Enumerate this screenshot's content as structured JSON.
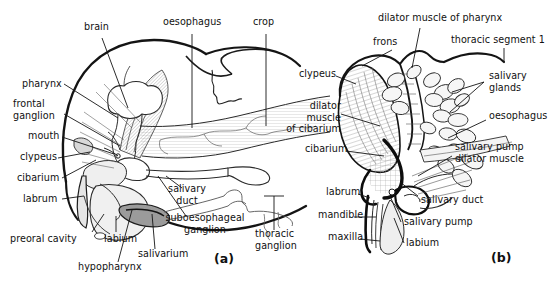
{
  "figure": {
    "background_color": "#ffffff",
    "ink_color": "#111111",
    "tint_color": "#cfcfcf",
    "width": 559,
    "height": 288,
    "panels": [
      {
        "id": "a",
        "caption": "(a)",
        "caption_x": 214,
        "caption_y": 251,
        "labels": [
          {
            "key": "brain",
            "text": "brain",
            "x": 84,
            "y": 27,
            "align": "left",
            "lines": [
              "brain"
            ]
          },
          {
            "key": "oesophagus",
            "text": "oesophagus",
            "x": 163,
            "y": 21,
            "align": "left",
            "lines": [
              "oesophagus"
            ]
          },
          {
            "key": "crop",
            "text": "crop",
            "x": 253,
            "y": 21,
            "align": "left",
            "lines": [
              "crop"
            ]
          },
          {
            "key": "pharynx",
            "text": "pharynx",
            "x": 22,
            "y": 79,
            "align": "left",
            "lines": [
              "pharynx"
            ]
          },
          {
            "key": "frontal-ganglion",
            "text": "frontal ganglion",
            "x": 13,
            "y": 102,
            "align": "left",
            "lines": [
              "frontal",
              "ganglion"
            ]
          },
          {
            "key": "mouth",
            "text": "mouth",
            "x": 28,
            "y": 136,
            "align": "left",
            "lines": [
              "mouth"
            ]
          },
          {
            "key": "clypeus",
            "text": "clypeus",
            "x": 20,
            "y": 157,
            "align": "left",
            "lines": [
              "clypeus"
            ]
          },
          {
            "key": "cibarium",
            "text": "cibarium",
            "x": 17,
            "y": 177,
            "align": "left",
            "lines": [
              "cibarium"
            ]
          },
          {
            "key": "labrum",
            "text": "labrum",
            "x": 23,
            "y": 198,
            "align": "left",
            "lines": [
              "labrum"
            ]
          },
          {
            "key": "preoral-cavity",
            "text": "preoral cavity",
            "x": 13,
            "y": 238,
            "align": "left",
            "lines": [
              "preoral cavity"
            ]
          },
          {
            "key": "labium",
            "text": "labium",
            "x": 104,
            "y": 238,
            "align": "left",
            "lines": [
              "labium"
            ]
          },
          {
            "key": "hypopharynx",
            "text": "hypopharynx",
            "x": 78,
            "y": 266,
            "align": "left",
            "lines": [
              "hypopharynx"
            ]
          },
          {
            "key": "salivarium",
            "text": "salivarium",
            "x": 140,
            "y": 253,
            "align": "left",
            "lines": [
              "salivarium"
            ]
          },
          {
            "key": "salivary-duct",
            "text": "salivary duct",
            "x": 185,
            "y": 192,
            "align": "center",
            "lines": [
              "salivary",
              "duct"
            ]
          },
          {
            "key": "suboesophageal-ganglion",
            "text": "suboesophageal ganglion",
            "x": 163,
            "y": 221,
            "align": "left",
            "lines": [
              "suboesophageal",
              "ganglion"
            ]
          },
          {
            "key": "thoracic-ganglion",
            "text": "thoracic ganglion",
            "x": 255,
            "y": 233,
            "align": "left",
            "lines": [
              "thoracic",
              "ganglion"
            ]
          }
        ]
      },
      {
        "id": "b",
        "caption": "(b)",
        "caption_x": 491,
        "caption_y": 250,
        "labels": [
          {
            "key": "dilator-muscle-of-pharynx",
            "text": "dilator muscle of pharynx",
            "x": 378,
            "y": 15,
            "align": "left",
            "lines": [
              "dilator muscle of pharynx"
            ]
          },
          {
            "key": "frons",
            "text": "frons",
            "x": 373,
            "y": 40,
            "align": "left",
            "lines": [
              "frons"
            ]
          },
          {
            "key": "thoracic-segment-1",
            "text": "thoracic segment 1",
            "x": 456,
            "y": 38,
            "align": "left",
            "lines": [
              "thoracic segment 1"
            ]
          },
          {
            "key": "clypeus-b",
            "text": "clypeus",
            "x": 301,
            "y": 72,
            "align": "left",
            "lines": [
              "clypeus"
            ]
          },
          {
            "key": "salivary-glands",
            "text": "salivary glands",
            "x": 488,
            "y": 73,
            "align": "left",
            "lines": [
              "salivary",
              "glands"
            ]
          },
          {
            "key": "dilator-muscle-of-cibarium",
            "text": "dilator muscle of cibarium",
            "x": 291,
            "y": 104,
            "align": "left",
            "lines": [
              "dilator",
              "muscle",
              "of cibarium"
            ]
          },
          {
            "key": "oesophagus-b",
            "text": "oesophagus",
            "x": 488,
            "y": 114,
            "align": "left",
            "lines": [
              "oesophagus"
            ]
          },
          {
            "key": "cibarium-b",
            "text": "cibarium",
            "x": 307,
            "y": 147,
            "align": "left",
            "lines": [
              "cibarium"
            ]
          },
          {
            "key": "salivary-pump-dilator-muscle",
            "text": "salivary pump dilator muscle",
            "x": 455,
            "y": 145,
            "align": "left",
            "lines": [
              "salivary pump",
              "dilator muscle"
            ]
          },
          {
            "key": "labrum-b",
            "text": "labrum",
            "x": 328,
            "y": 190,
            "align": "left",
            "lines": [
              "labrum"
            ]
          },
          {
            "key": "salivary-duct-b",
            "text": "salivary duct",
            "x": 421,
            "y": 198,
            "align": "left",
            "lines": [
              "salivary duct"
            ]
          },
          {
            "key": "mandible",
            "text": "mandible",
            "x": 320,
            "y": 213,
            "align": "left",
            "lines": [
              "mandible"
            ]
          },
          {
            "key": "salivary-pump",
            "text": "salivary pump",
            "x": 404,
            "y": 220,
            "align": "left",
            "lines": [
              "salivary pump"
            ]
          },
          {
            "key": "maxilla",
            "text": "maxilla",
            "x": 330,
            "y": 235,
            "align": "left",
            "lines": [
              "maxilla"
            ]
          },
          {
            "key": "labium-b",
            "text": "labium",
            "x": 406,
            "y": 241,
            "align": "left",
            "lines": [
              "labium"
            ]
          }
        ]
      }
    ]
  }
}
